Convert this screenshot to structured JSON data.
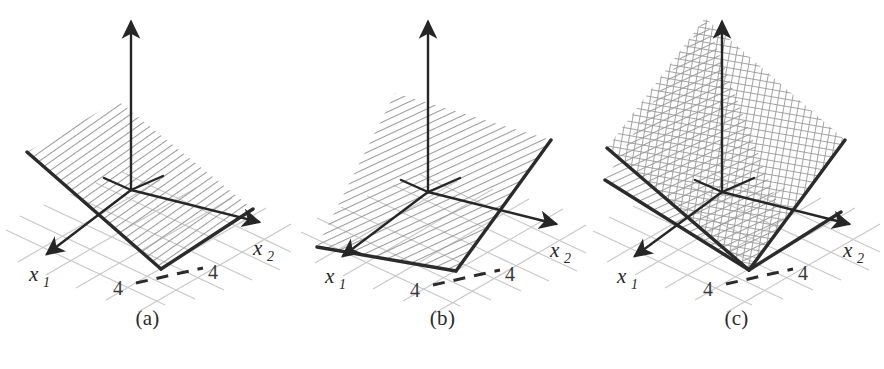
{
  "figure": {
    "name": "three-panel-3d-halfspace-figure",
    "background": "#ffffff",
    "panel_count": 3
  },
  "style": {
    "grid_color": "#c9c9c9",
    "hatch_color": "#9a9a9a",
    "edge_color": "#2b2b2b",
    "axis_color": "#262626",
    "text_color": "#2a2a2a"
  },
  "panels": [
    {
      "id": "a",
      "caption": "(a)",
      "axes": {
        "x1_label": "x",
        "x1_sub": "1",
        "x2_label": "x",
        "x2_sub": "2"
      },
      "ticks": {
        "left": "4",
        "right": "4"
      },
      "plane": {
        "fill_pattern": "hatch-vertical-diagonal",
        "description": "single plane sloping down to the front edge"
      }
    },
    {
      "id": "b",
      "caption": "(b)",
      "axes": {
        "x1_label": "x",
        "x1_sub": "1",
        "x2_label": "x",
        "x2_sub": "2"
      },
      "ticks": {
        "left": "4",
        "right": "4"
      },
      "plane": {
        "fill_pattern": "hatch-diagonal",
        "description": "single plane tilted upward to the right"
      }
    },
    {
      "id": "c",
      "caption": "(c)",
      "axes": {
        "x1_label": "x",
        "x1_sub": "1",
        "x2_label": "x",
        "x2_sub": "2"
      },
      "ticks": {
        "left": "4",
        "right": "4"
      },
      "plane": {
        "fill_pattern": "crosshatch-and-hatch",
        "description": "two intersecting planes, upper crosshatched and lower hatched"
      }
    }
  ]
}
